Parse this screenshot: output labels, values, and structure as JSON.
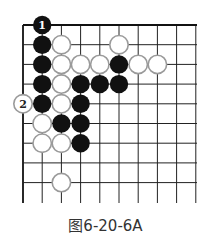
{
  "diagram": {
    "type": "go-board-diagram",
    "grid": {
      "origin_x": 23,
      "origin_y": 25,
      "dx": 19.2,
      "dy": 19.7,
      "columns": 10,
      "rows": 9,
      "right_extent": 197,
      "bottom_extent": 203,
      "line_color": "#222222",
      "edge_color": "#111111"
    },
    "stones": [
      {
        "color": "black",
        "col": 1,
        "row": 0,
        "label": "1"
      },
      {
        "color": "black",
        "col": 1,
        "row": 1
      },
      {
        "color": "white",
        "col": 2,
        "row": 1
      },
      {
        "color": "white",
        "col": 5,
        "row": 1
      },
      {
        "color": "black",
        "col": 1,
        "row": 2
      },
      {
        "color": "white",
        "col": 2,
        "row": 2
      },
      {
        "color": "white",
        "col": 3,
        "row": 2
      },
      {
        "color": "white",
        "col": 4,
        "row": 2
      },
      {
        "color": "black",
        "col": 5,
        "row": 2
      },
      {
        "color": "white",
        "col": 6,
        "row": 2
      },
      {
        "color": "white",
        "col": 7,
        "row": 2
      },
      {
        "color": "black",
        "col": 1,
        "row": 3
      },
      {
        "color": "white",
        "col": 2,
        "row": 3
      },
      {
        "color": "black",
        "col": 3,
        "row": 3
      },
      {
        "color": "black",
        "col": 4,
        "row": 3
      },
      {
        "color": "black",
        "col": 5,
        "row": 3
      },
      {
        "color": "white",
        "col": 0,
        "row": 4,
        "label": "2"
      },
      {
        "color": "black",
        "col": 1,
        "row": 4
      },
      {
        "color": "white",
        "col": 2,
        "row": 4
      },
      {
        "color": "black",
        "col": 3,
        "row": 4
      },
      {
        "color": "white",
        "col": 1,
        "row": 5
      },
      {
        "color": "black",
        "col": 2,
        "row": 5
      },
      {
        "color": "black",
        "col": 3,
        "row": 5
      },
      {
        "color": "white",
        "col": 1,
        "row": 6
      },
      {
        "color": "white",
        "col": 2,
        "row": 6
      },
      {
        "color": "black",
        "col": 3,
        "row": 6
      },
      {
        "color": "white",
        "col": 2,
        "row": 8
      }
    ],
    "colors": {
      "black_stone": "#111111",
      "white_stone_fill": "#ffffff",
      "white_stone_stroke": "#9a9a9a",
      "label_on_black": "#ffffff",
      "label_on_white": "#222222"
    }
  },
  "caption": "图6-20-6A"
}
